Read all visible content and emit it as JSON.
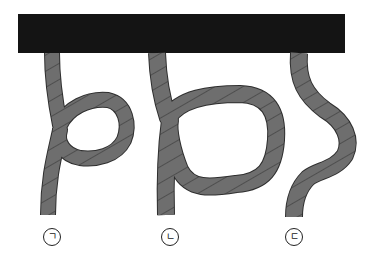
{
  "figure": {
    "colors": {
      "bar": "#141414",
      "rope_fill": "#6e6e6e",
      "rope_segment_line": "#2e2e2e",
      "background": "#ffffff",
      "label": "#222222"
    },
    "ropes": [
      {
        "id": "rope-a",
        "label": "ㄱ",
        "shape": "small loop crossing over the rope"
      },
      {
        "id": "rope-b",
        "label": "ㄴ",
        "shape": "large loop crossing over the rope"
      },
      {
        "id": "rope-c",
        "label": "ㄷ",
        "shape": "S-shaped bend without loop"
      }
    ]
  }
}
